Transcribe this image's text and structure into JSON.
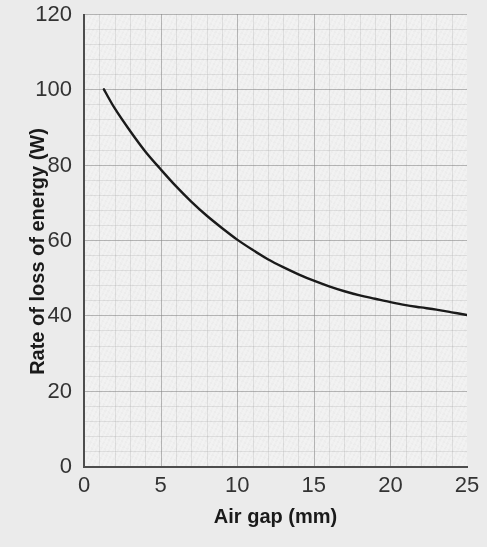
{
  "chart_data": {
    "type": "line",
    "title": "",
    "xlabel": "Air gap (mm)",
    "ylabel": "Rate of loss of energy (W)",
    "xlim": [
      0,
      25
    ],
    "ylim": [
      0,
      120
    ],
    "xticks": [
      "0",
      "5",
      "10",
      "15",
      "20",
      "25"
    ],
    "xtick_values": [
      0,
      5,
      10,
      15,
      20,
      25
    ],
    "yticks": [
      "0",
      "20",
      "40",
      "60",
      "80",
      "100",
      "120"
    ],
    "ytick_values": [
      0,
      20,
      40,
      60,
      80,
      100,
      120
    ],
    "grid": true,
    "grid_style": "graph-paper, major and minor",
    "legend": "none",
    "series": [
      {
        "name": "Rate of loss of energy",
        "color": "#1a1a1a",
        "line_width": 2.4,
        "x": [
          1.3,
          2,
          3,
          4,
          5,
          6,
          7,
          8,
          9,
          10,
          11,
          12,
          13,
          14,
          15,
          16,
          17,
          18,
          19,
          20,
          21,
          22,
          23,
          24,
          25
        ],
        "y": [
          100.0,
          95.0,
          89.0,
          83.5,
          78.8,
          74.3,
          70.2,
          66.5,
          63.2,
          60.1,
          57.4,
          54.9,
          52.8,
          50.9,
          49.2,
          47.7,
          46.4,
          45.3,
          44.4,
          43.5,
          42.7,
          42.1,
          41.5,
          40.8,
          40.1
        ]
      }
    ],
    "annotations": []
  },
  "axes": {
    "x_title": "Air gap (mm)",
    "y_title": "Rate of loss of energy (W)"
  },
  "colors": {
    "figure_background": "#ebebeb",
    "plot_background": "#f2f2f2",
    "curve": "#1a1a1a",
    "spine": "#4d4d4d",
    "tick_text": "#333333",
    "axis_title_text": "#1a1a1a",
    "grid_major": "#828282",
    "grid_minor": "#969696"
  }
}
